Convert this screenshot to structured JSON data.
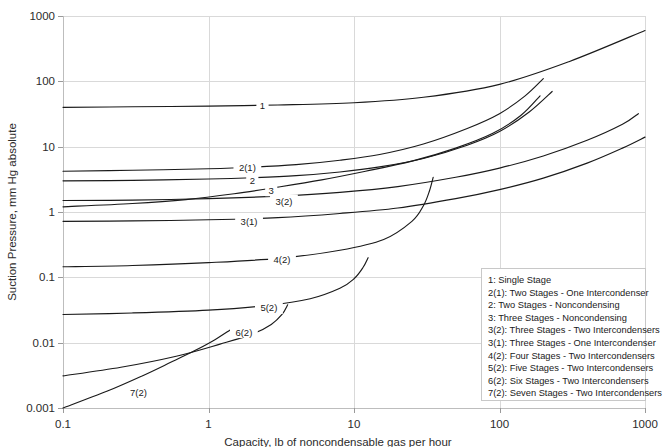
{
  "chart_data": {
    "type": "line",
    "title": "",
    "xlabel": "Capacity, lb of noncondensable gas per hour",
    "ylabel": "Suction Pressure, mm Hg absolute",
    "xscale": "log",
    "yscale": "log",
    "xlim": [
      0.1,
      1000
    ],
    "ylim": [
      0.001,
      1000
    ],
    "xticks": [
      "0.1",
      "1",
      "10",
      "100",
      "1000"
    ],
    "xtick_values": [
      0.1,
      1,
      10,
      100,
      1000
    ],
    "yticks": [
      "0.001",
      "0.01",
      "0.1",
      "1",
      "10",
      "100",
      "1000"
    ],
    "ytick_values": [
      0.001,
      0.01,
      0.1,
      1,
      10,
      100,
      1000
    ],
    "grid": true,
    "legend_position": "bottom-right",
    "series": [
      {
        "name": "1",
        "legend": "1: Single Stage",
        "label": "1",
        "label_at": [
          2.35,
          42
        ],
        "x": [
          0.1,
          0.3,
          1,
          3,
          10,
          30,
          100,
          300,
          1000
        ],
        "y": [
          40,
          40.8,
          41.8,
          43.5,
          47,
          57,
          90,
          200,
          600
        ]
      },
      {
        "name": "2(1)",
        "legend": "2(1): Two Stages - One Intercondenser",
        "label": "2(1)",
        "label_at": [
          1.85,
          4.8
        ],
        "x": [
          0.1,
          0.3,
          1,
          2,
          4,
          8,
          15,
          30,
          60,
          100,
          150,
          200
        ],
        "y": [
          4.2,
          4.35,
          4.6,
          4.85,
          5.3,
          6.2,
          7.6,
          11,
          19,
          32,
          60,
          110
        ]
      },
      {
        "name": "2",
        "legend": "2: Two Stages - Noncondensing",
        "label": "2",
        "label_at": [
          2.0,
          3.0
        ],
        "x": [
          0.1,
          0.3,
          1,
          2,
          4,
          8,
          15,
          30,
          60,
          100,
          160,
          230
        ],
        "y": [
          3.0,
          3.05,
          3.2,
          3.35,
          3.6,
          4.1,
          4.9,
          6.6,
          10.5,
          17,
          34,
          70
        ]
      },
      {
        "name": "3",
        "legend": "3: Three Stages - Noncondensing",
        "label": "3",
        "label_at": [
          2.7,
          2.15
        ],
        "x": [
          0.1,
          0.3,
          0.7,
          1.5,
          3,
          6,
          12,
          25,
          50,
          90,
          140,
          190
        ],
        "y": [
          1.2,
          1.35,
          1.55,
          1.9,
          2.4,
          3.1,
          4.2,
          6.0,
          9.5,
          16,
          30,
          60
        ]
      },
      {
        "name": "3(2)",
        "legend": "3(2): Three Stages - Two Intercondensers",
        "label": "3(2)",
        "label_at": [
          3.3,
          1.45
        ],
        "x": [
          0.1,
          0.3,
          1,
          3,
          8,
          20,
          50,
          100,
          200,
          400,
          700,
          900
        ],
        "y": [
          1.5,
          1.52,
          1.6,
          1.75,
          2.0,
          2.45,
          3.4,
          4.7,
          7.2,
          12.5,
          22,
          32
        ]
      },
      {
        "name": "3(1)",
        "legend": "3(1): Three Stages - One Intercondenser",
        "label": "3(1)",
        "label_at": [
          1.9,
          0.72
        ],
        "x": [
          0.1,
          0.3,
          1,
          3,
          8,
          20,
          50,
          100,
          200,
          400,
          700,
          1000
        ],
        "y": [
          0.72,
          0.73,
          0.76,
          0.82,
          0.95,
          1.15,
          1.6,
          2.2,
          3.3,
          5.6,
          9.5,
          14
        ]
      },
      {
        "name": "4(2)",
        "legend": "4(2): Four Stages - Two Intercondensers",
        "label": "4(2)",
        "label_at": [
          3.2,
          0.185
        ],
        "x": [
          0.1,
          0.3,
          1,
          3,
          8,
          16,
          25,
          30,
          33,
          35
        ],
        "y": [
          0.145,
          0.152,
          0.168,
          0.195,
          0.26,
          0.38,
          0.72,
          1.25,
          2.1,
          3.4
        ]
      },
      {
        "name": "5(2)",
        "legend": "5(2): Five Stages - Two Intercondensers",
        "label": "5(2)",
        "label_at": [
          2.6,
          0.034
        ],
        "x": [
          0.1,
          0.3,
          1,
          2.5,
          5,
          8,
          10,
          11.5,
          12.5
        ],
        "y": [
          0.027,
          0.0285,
          0.0315,
          0.037,
          0.047,
          0.068,
          0.095,
          0.14,
          0.2
        ]
      },
      {
        "name": "6(2)",
        "legend": "6(2): Six Stages - Two Intercondensers",
        "label": "6(2)",
        "label_at": [
          1.75,
          0.0145
        ],
        "x": [
          0.1,
          0.25,
          0.6,
          1.2,
          2.0,
          2.7,
          3.2,
          3.5
        ],
        "y": [
          0.0031,
          0.0042,
          0.0062,
          0.0095,
          0.0135,
          0.019,
          0.027,
          0.038
        ]
      },
      {
        "name": "7(2)",
        "legend": "7(2): Seven Stages - Two Intercondensers",
        "label": "7(2)",
        "label_at": [
          0.33,
          0.00175
        ],
        "x": [
          0.1,
          0.2,
          0.35,
          0.55,
          0.8,
          1.1,
          1.4
        ],
        "y": [
          0.001,
          0.0018,
          0.0031,
          0.005,
          0.0075,
          0.011,
          0.0155
        ]
      }
    ]
  },
  "colors": {
    "curve": "#1a1a1a",
    "grid": "#d9d9d9",
    "axis": "#bdbdbd",
    "text": "#2b2b2b",
    "background": "#ffffff"
  }
}
